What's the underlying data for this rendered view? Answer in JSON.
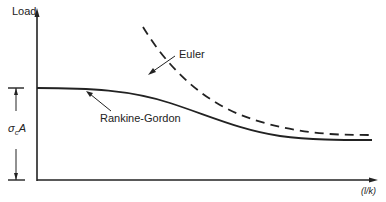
{
  "diagram": {
    "y_axis_label": "Load",
    "x_axis_label": "(l/k)",
    "curves": [
      {
        "name": "Euler",
        "style": "dashed"
      },
      {
        "name": "Rankine-Gordon",
        "style": "solid"
      }
    ],
    "dimension_label": "σcA",
    "dimension_base": "σ",
    "dimension_sub": "c",
    "dimension_tail": "A",
    "colors": {
      "ink": "#222222",
      "background": "#ffffff"
    }
  }
}
